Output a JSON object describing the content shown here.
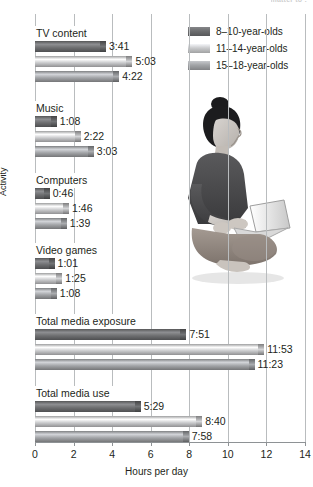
{
  "top_cut_text": "matter to :",
  "chart_data": {
    "type": "bar",
    "orientation": "horizontal",
    "title": "",
    "xlabel": "Hours per day",
    "ylabel": "Activity",
    "xlim": [
      0,
      14
    ],
    "xticks": [
      0,
      2,
      4,
      6,
      8,
      10,
      12,
      14
    ],
    "grid": true,
    "legend_position": "top-right",
    "categories": [
      "TV content",
      "Music",
      "Computers",
      "Video games",
      "Total media exposure",
      "Total media use"
    ],
    "series": [
      {
        "name": "8–10-year-olds",
        "color": "#6d6e70",
        "labels": [
          "3:41",
          "1:08",
          "0:46",
          "1:01",
          "7:51",
          "5:29"
        ],
        "values": [
          3.683,
          1.133,
          0.767,
          1.017,
          7.85,
          5.483
        ]
      },
      {
        "name": "11–14-year-olds",
        "color": "#c9cacc",
        "labels": [
          "5:03",
          "2:22",
          "1:46",
          "1:25",
          "11:53",
          "8:40"
        ],
        "values": [
          5.05,
          2.367,
          1.767,
          1.417,
          11.883,
          8.667
        ]
      },
      {
        "name": "15–18-year-olds",
        "color": "#a2a4a7",
        "labels": [
          "4:22",
          "3:03",
          "1:39",
          "1:08",
          "11:23",
          "7:58"
        ],
        "values": [
          4.367,
          3.05,
          1.65,
          1.133,
          11.383,
          7.967
        ]
      }
    ]
  },
  "photo": {
    "alt_name": "woman-with-laptop-photo"
  }
}
